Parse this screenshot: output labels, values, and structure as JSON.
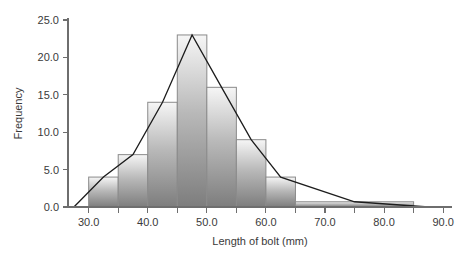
{
  "chart_data": {
    "type": "bar",
    "title": "",
    "subtitle": "",
    "xlabel": "Length of bolt (mm)",
    "ylabel": "Frequency",
    "xlim": [
      26.5,
      91.5
    ],
    "ylim": [
      0,
      25.0
    ],
    "grid": false,
    "legend": null,
    "x_major_ticks": [
      30.0,
      40.0,
      50.0,
      60.0,
      70.0,
      80.0,
      90.0
    ],
    "x_major_tick_labels": [
      "30.0",
      "40.0",
      "50.0",
      "60.0",
      "70.0",
      "80.0",
      "90.0"
    ],
    "x_minor_ticks": [
      35.0,
      45.0,
      55.0,
      65.0,
      75.0,
      85.0
    ],
    "y_ticks": [
      0.0,
      5.0,
      10.0,
      15.0,
      20.0,
      25.0
    ],
    "y_tick_labels": [
      "0.0",
      "5.0",
      "10.0",
      "15.0",
      "20.0",
      "25.0"
    ],
    "bin_edges": [
      30,
      35,
      40,
      45,
      50,
      55,
      60,
      65,
      85
    ],
    "categories": [
      "30-35",
      "35-40",
      "40-45",
      "45-50",
      "50-55",
      "55-60",
      "60-65",
      "65-85"
    ],
    "values": [
      4,
      7,
      14,
      23,
      16,
      9,
      4,
      0.7
    ],
    "bars": [
      {
        "x0": 30,
        "x1": 35,
        "height": 4
      },
      {
        "x0": 35,
        "x1": 40,
        "height": 7
      },
      {
        "x0": 40,
        "x1": 45,
        "height": 14
      },
      {
        "x0": 45,
        "x1": 50,
        "height": 23
      },
      {
        "x0": 50,
        "x1": 55,
        "height": 16
      },
      {
        "x0": 55,
        "x1": 60,
        "height": 9
      },
      {
        "x0": 60,
        "x1": 65,
        "height": 4
      },
      {
        "x0": 65,
        "x1": 85,
        "height": 0.7
      }
    ],
    "overlay_series": {
      "name": "frequency polygon",
      "type": "line",
      "points": [
        [
          27.5,
          0
        ],
        [
          32.5,
          4
        ],
        [
          37.5,
          7
        ],
        [
          42.5,
          14
        ],
        [
          47.5,
          23
        ],
        [
          52.5,
          16
        ],
        [
          57.5,
          9
        ],
        [
          62.5,
          4
        ],
        [
          75.0,
          0.7
        ],
        [
          87.5,
          0
        ]
      ]
    },
    "colors": {
      "background": "#ffffff",
      "bar_fill_top": "#f2f2f2",
      "bar_fill_bottom": "#7d7d7d",
      "bar_stroke": "#8a8a8a",
      "line": "#1c1c1c",
      "axis": "#6e6e6e",
      "text": "#3a3a3a"
    }
  }
}
